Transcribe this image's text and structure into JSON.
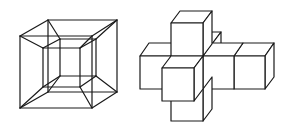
{
  "figures": [
    {
      "name": "tesseract-projection",
      "description": "Wireframe perspective projection of a hypercube (cube within a cube)",
      "stroke_color": "#1a1a1a"
    },
    {
      "name": "unfolded-tesseract-net",
      "description": "3D cross of eight cubes (hypercube net), drawn in oblique projection",
      "stroke_color": "#1a1a1a"
    }
  ],
  "background_color": "#ffffff"
}
